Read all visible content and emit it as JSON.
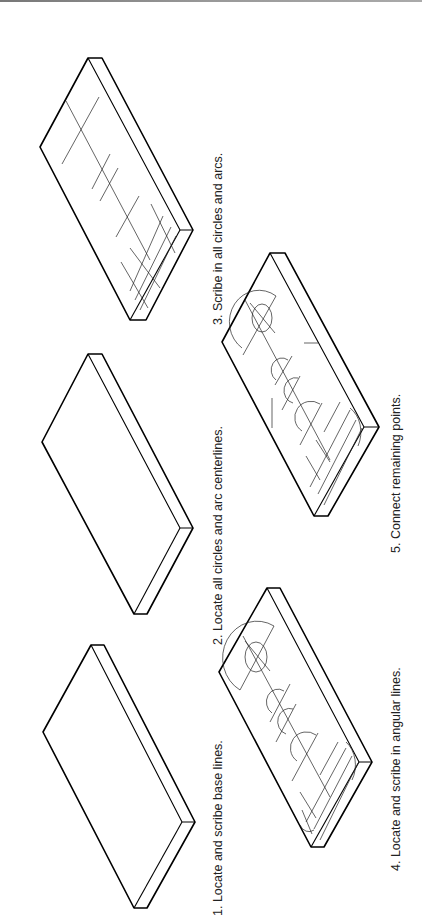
{
  "figure": {
    "orientation": "rotated-90-ccw",
    "steps": [
      {
        "id": 1,
        "label": "1. Locate and scribe base lines."
      },
      {
        "id": 2,
        "label": "2. Locate all circles and arc centerlines."
      },
      {
        "id": 3,
        "label": "3. Scribe in all circles and arcs."
      },
      {
        "id": 4,
        "label": "4. Locate and scribe in angular lines."
      },
      {
        "id": 5,
        "label": "5. Connect remaining points."
      }
    ]
  }
}
